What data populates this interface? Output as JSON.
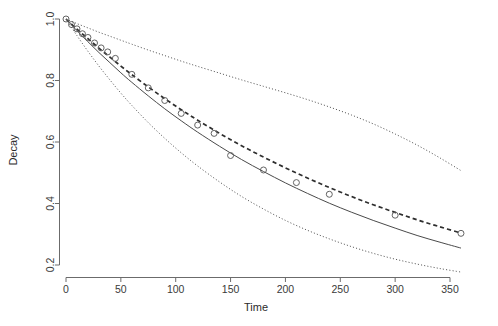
{
  "chart_data": {
    "type": "line",
    "title": "",
    "xlabel": "Time",
    "ylabel": "Decay",
    "xlim": [
      -8,
      375
    ],
    "ylim": [
      0.17,
      1.03
    ],
    "grid": false,
    "legend": "none",
    "xticks": [
      0,
      50,
      100,
      150,
      200,
      250,
      300,
      350
    ],
    "xtick_labels": [
      "0",
      "50",
      "100",
      "150",
      "200",
      "250",
      "300",
      "350"
    ],
    "yticks": [
      0.2,
      0.4,
      0.6,
      0.8,
      1.0
    ],
    "ytick_labels": [
      "0.2",
      "0.4",
      "0.6",
      "0.8",
      "1.0"
    ],
    "series": [
      {
        "name": "upper-confidence-band",
        "style": "dotted",
        "x": [
          0,
          10,
          20,
          30,
          40,
          50,
          60,
          75,
          90,
          105,
          120,
          140,
          160,
          180,
          200,
          220,
          240,
          260,
          280,
          300,
          320,
          340,
          360
        ],
        "y": [
          1.0,
          0.985,
          0.971,
          0.957,
          0.944,
          0.931,
          0.918,
          0.899,
          0.881,
          0.863,
          0.846,
          0.824,
          0.802,
          0.781,
          0.76,
          0.738,
          0.714,
          0.688,
          0.659,
          0.626,
          0.59,
          0.55,
          0.507
        ]
      },
      {
        "name": "fitted-dashed-curve",
        "style": "dashed",
        "x": [
          0,
          10,
          20,
          30,
          40,
          50,
          60,
          75,
          90,
          105,
          120,
          140,
          160,
          180,
          200,
          220,
          240,
          260,
          280,
          300,
          320,
          340,
          360
        ],
        "y": [
          1.0,
          0.967,
          0.936,
          0.905,
          0.876,
          0.847,
          0.819,
          0.779,
          0.741,
          0.705,
          0.671,
          0.628,
          0.588,
          0.551,
          0.516,
          0.483,
          0.452,
          0.423,
          0.396,
          0.371,
          0.347,
          0.325,
          0.304
        ]
      },
      {
        "name": "true-solid-curve",
        "style": "solid",
        "x": [
          0,
          10,
          20,
          30,
          40,
          50,
          60,
          75,
          90,
          105,
          120,
          140,
          160,
          180,
          200,
          220,
          240,
          260,
          280,
          300,
          320,
          340,
          360
        ],
        "y": [
          1.0,
          0.962,
          0.926,
          0.891,
          0.858,
          0.825,
          0.794,
          0.75,
          0.708,
          0.669,
          0.632,
          0.586,
          0.543,
          0.504,
          0.467,
          0.433,
          0.401,
          0.372,
          0.345,
          0.32,
          0.296,
          0.275,
          0.255
        ]
      },
      {
        "name": "lower-confidence-band",
        "style": "dotted",
        "x": [
          0,
          10,
          20,
          30,
          40,
          50,
          60,
          75,
          90,
          105,
          120,
          140,
          160,
          180,
          200,
          220,
          240,
          260,
          280,
          300,
          320,
          340,
          360
        ],
        "y": [
          1.0,
          0.946,
          0.895,
          0.847,
          0.802,
          0.759,
          0.719,
          0.663,
          0.612,
          0.565,
          0.522,
          0.47,
          0.423,
          0.382,
          0.345,
          0.313,
          0.285,
          0.26,
          0.238,
          0.219,
          0.203,
          0.189,
          0.177
        ]
      }
    ],
    "points": {
      "name": "observed-data-points",
      "marker": "open-circle",
      "x": [
        0,
        6,
        12,
        18,
        24,
        30,
        36,
        42,
        60,
        75,
        90,
        105,
        150,
        180,
        210,
        240,
        300,
        360
      ],
      "y": [
        1.0,
        0.98,
        0.965,
        0.948,
        0.935,
        0.918,
        0.9,
        0.888,
        0.872,
        0.82,
        0.775,
        0.735,
        0.692,
        0.655,
        0.628,
        0.555,
        0.51,
        0.43,
        0.36,
        0.302
      ]
    },
    "points_xy": [
      [
        0,
        1.0
      ],
      [
        5,
        0.982
      ],
      [
        10,
        0.968
      ],
      [
        15,
        0.952
      ],
      [
        20,
        0.94
      ],
      [
        26,
        0.922
      ],
      [
        32,
        0.906
      ],
      [
        38,
        0.893
      ],
      [
        45,
        0.872
      ],
      [
        60,
        0.82
      ],
      [
        75,
        0.776
      ],
      [
        90,
        0.735
      ],
      [
        105,
        0.693
      ],
      [
        120,
        0.655
      ],
      [
        135,
        0.628
      ],
      [
        150,
        0.556
      ],
      [
        180,
        0.509
      ],
      [
        210,
        0.468
      ],
      [
        240,
        0.43
      ],
      [
        300,
        0.362
      ],
      [
        360,
        0.303
      ]
    ]
  }
}
